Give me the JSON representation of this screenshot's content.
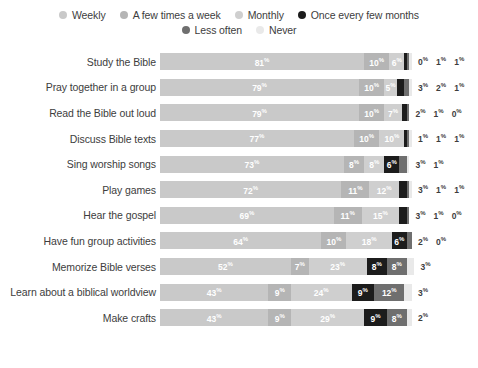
{
  "legend": {
    "rows": [
      [
        {
          "label": "Weekly",
          "color": "#c9c9c9",
          "key": "weekly"
        },
        {
          "label": "A few times a week",
          "color": "#b5b5b5",
          "key": "few_times_week"
        },
        {
          "label": "Monthly",
          "color": "#cfcfcf",
          "key": "monthly"
        },
        {
          "label": "Once every few months",
          "color": "#1c1c1c",
          "key": "once_every_few_months"
        }
      ],
      [
        {
          "label": "Less often",
          "color": "#6f6f6f",
          "key": "less_often"
        },
        {
          "label": "Never",
          "color": "#e9e9e9",
          "key": "never"
        }
      ]
    ]
  },
  "chart_data": {
    "type": "bar",
    "orientation": "horizontal",
    "stacked": true,
    "title": "",
    "xlabel": "",
    "ylabel": "",
    "xlim": [
      0,
      100
    ],
    "grid": false,
    "legend_position": "top",
    "value_suffix": "%",
    "categories": [
      "Study the Bible",
      "Pray together in a group",
      "Read the Bible out loud",
      "Discuss Bible texts",
      "Sing worship songs",
      "Play games",
      "Hear the gospel",
      "Have fun group activities",
      "Memorize Bible verses",
      "Learn about a biblical worldview",
      "Make crafts"
    ],
    "series": [
      {
        "name": "Weekly",
        "color": "#c9c9c9",
        "text_color": "#ffffff",
        "values": [
          81,
          79,
          79,
          77,
          73,
          72,
          69,
          64,
          52,
          43,
          43
        ]
      },
      {
        "name": "A few times a week",
        "color": "#b5b5b5",
        "text_color": "#ffffff",
        "values": [
          10,
          10,
          10,
          10,
          8,
          11,
          11,
          10,
          7,
          9,
          9
        ]
      },
      {
        "name": "Monthly",
        "color": "#cfcfcf",
        "text_color": "#ffffff",
        "values": [
          6,
          5,
          7,
          10,
          8,
          12,
          15,
          18,
          23,
          24,
          29
        ]
      },
      {
        "name": "Once every few months",
        "color": "#1c1c1c",
        "text_color": "#ffffff",
        "values": [
          0,
          3,
          2,
          1,
          6,
          3,
          3,
          6,
          8,
          9,
          9
        ]
      },
      {
        "name": "Less often",
        "color": "#6f6f6f",
        "text_color": "#ffffff",
        "values": [
          1,
          2,
          1,
          1,
          3,
          1,
          1,
          2,
          8,
          12,
          8
        ]
      },
      {
        "name": "Never",
        "color": "#e9e9e9",
        "text_color": "#3d3d3d",
        "values": [
          1,
          1,
          0,
          1,
          1,
          1,
          0,
          0,
          3,
          3,
          2
        ]
      }
    ],
    "rows": [
      {
        "label": "Study the Bible",
        "segments": [
          {
            "series": "Weekly",
            "value": 81,
            "inside": true
          },
          {
            "series": "A few times a week",
            "value": 10,
            "inside": true
          },
          {
            "series": "Monthly",
            "value": 6,
            "inside": true
          },
          {
            "series": "Once every few months",
            "value": 0,
            "inside": false
          },
          {
            "series": "Less often",
            "value": 1,
            "inside": false
          },
          {
            "series": "Never",
            "value": 1,
            "inside": false
          }
        ]
      },
      {
        "label": "Pray together in a group",
        "segments": [
          {
            "series": "Weekly",
            "value": 79,
            "inside": true
          },
          {
            "series": "A few times a week",
            "value": 10,
            "inside": true
          },
          {
            "series": "Monthly",
            "value": 5,
            "inside": true
          },
          {
            "series": "Once every few months",
            "value": 3,
            "inside": false
          },
          {
            "series": "Less often",
            "value": 2,
            "inside": false
          },
          {
            "series": "Never",
            "value": 1,
            "inside": false
          }
        ]
      },
      {
        "label": "Read the Bible out loud",
        "segments": [
          {
            "series": "Weekly",
            "value": 79,
            "inside": true
          },
          {
            "series": "A few times a week",
            "value": 10,
            "inside": true
          },
          {
            "series": "Monthly",
            "value": 7,
            "inside": true
          },
          {
            "series": "Once every few months",
            "value": 2,
            "inside": false
          },
          {
            "series": "Less often",
            "value": 1,
            "inside": false
          },
          {
            "series": "Never",
            "value": 0,
            "inside": false
          }
        ]
      },
      {
        "label": "Discuss Bible texts",
        "segments": [
          {
            "series": "Weekly",
            "value": 77,
            "inside": true
          },
          {
            "series": "A few times a week",
            "value": 10,
            "inside": true
          },
          {
            "series": "Monthly",
            "value": 10,
            "inside": true
          },
          {
            "series": "Once every few months",
            "value": 1,
            "inside": false
          },
          {
            "series": "Less often",
            "value": 1,
            "inside": false
          },
          {
            "series": "Never",
            "value": 1,
            "inside": false
          }
        ]
      },
      {
        "label": "Sing worship songs",
        "segments": [
          {
            "series": "Weekly",
            "value": 73,
            "inside": true
          },
          {
            "series": "A few times a week",
            "value": 8,
            "inside": true
          },
          {
            "series": "Monthly",
            "value": 8,
            "inside": true
          },
          {
            "series": "Once every few months",
            "value": 6,
            "inside": true
          },
          {
            "series": "Less often",
            "value": 3,
            "inside": false
          },
          {
            "series": "Never",
            "value": 1,
            "inside": false
          }
        ]
      },
      {
        "label": "Play games",
        "segments": [
          {
            "series": "Weekly",
            "value": 72,
            "inside": true
          },
          {
            "series": "A few times a week",
            "value": 11,
            "inside": true
          },
          {
            "series": "Monthly",
            "value": 12,
            "inside": true
          },
          {
            "series": "Once every few months",
            "value": 3,
            "inside": false
          },
          {
            "series": "Less often",
            "value": 1,
            "inside": false
          },
          {
            "series": "Never",
            "value": 1,
            "inside": false
          }
        ]
      },
      {
        "label": "Hear the gospel",
        "segments": [
          {
            "series": "Weekly",
            "value": 69,
            "inside": true
          },
          {
            "series": "A few times a week",
            "value": 11,
            "inside": true
          },
          {
            "series": "Monthly",
            "value": 15,
            "inside": true
          },
          {
            "series": "Once every few months",
            "value": 3,
            "inside": false
          },
          {
            "series": "Less often",
            "value": 1,
            "inside": false
          },
          {
            "series": "Never",
            "value": 0,
            "inside": false
          }
        ]
      },
      {
        "label": "Have fun group activities",
        "segments": [
          {
            "series": "Weekly",
            "value": 64,
            "inside": true
          },
          {
            "series": "A few times a week",
            "value": 10,
            "inside": true
          },
          {
            "series": "Monthly",
            "value": 18,
            "inside": true
          },
          {
            "series": "Once every few months",
            "value": 6,
            "inside": true
          },
          {
            "series": "Less often",
            "value": 2,
            "inside": false
          },
          {
            "series": "Never",
            "value": 0,
            "inside": false
          }
        ]
      },
      {
        "label": "Memorize Bible verses",
        "segments": [
          {
            "series": "Weekly",
            "value": 52,
            "inside": true
          },
          {
            "series": "A few times a week",
            "value": 7,
            "inside": true
          },
          {
            "series": "Monthly",
            "value": 23,
            "inside": true
          },
          {
            "series": "Once every few months",
            "value": 8,
            "inside": true
          },
          {
            "series": "Less often",
            "value": 8,
            "inside": true
          },
          {
            "series": "Never",
            "value": 3,
            "inside": false
          }
        ]
      },
      {
        "label": "Learn about a biblical worldview",
        "segments": [
          {
            "series": "Weekly",
            "value": 43,
            "inside": true
          },
          {
            "series": "A few times a week",
            "value": 9,
            "inside": true
          },
          {
            "series": "Monthly",
            "value": 24,
            "inside": true
          },
          {
            "series": "Once every few months",
            "value": 9,
            "inside": true
          },
          {
            "series": "Less often",
            "value": 12,
            "inside": true
          },
          {
            "series": "Never",
            "value": 3,
            "inside": false
          }
        ]
      },
      {
        "label": "Make crafts",
        "segments": [
          {
            "series": "Weekly",
            "value": 43,
            "inside": true
          },
          {
            "series": "A few times a week",
            "value": 9,
            "inside": true
          },
          {
            "series": "Monthly",
            "value": 29,
            "inside": true
          },
          {
            "series": "Once every few months",
            "value": 9,
            "inside": true
          },
          {
            "series": "Less often",
            "value": 8,
            "inside": true
          },
          {
            "series": "Never",
            "value": 2,
            "inside": false
          }
        ]
      }
    ]
  }
}
